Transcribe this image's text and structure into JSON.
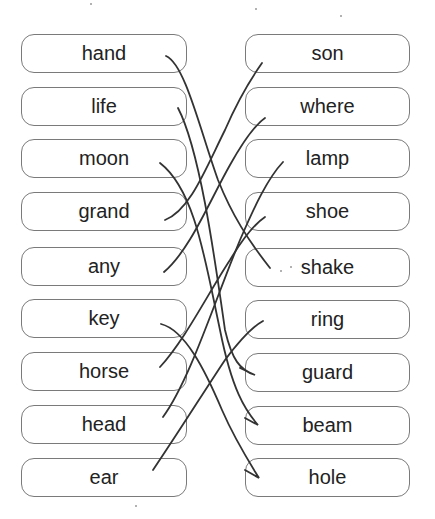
{
  "worksheet": {
    "left_words": [
      "hand",
      "life",
      "moon",
      "grand",
      "any",
      "key",
      "horse",
      "head",
      "ear"
    ],
    "right_words": [
      "son",
      "where",
      "lamp",
      "shoe",
      "shake",
      "ring",
      "guard",
      "beam",
      "hole"
    ],
    "matches": [
      {
        "left": "hand",
        "right": "shake"
      },
      {
        "left": "life",
        "right": "guard"
      },
      {
        "left": "moon",
        "right": "beam"
      },
      {
        "left": "grand",
        "right": "son"
      },
      {
        "left": "any",
        "right": "where"
      },
      {
        "left": "key",
        "right": "hole"
      },
      {
        "left": "horse",
        "right": "shoe"
      },
      {
        "left": "head",
        "right": "lamp"
      },
      {
        "left": "ear",
        "right": "ring"
      }
    ],
    "line_color": "#333333",
    "border_color": "#7a7a7a"
  }
}
